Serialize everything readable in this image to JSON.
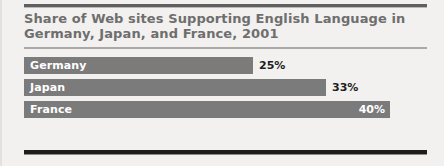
{
  "chart_data": {
    "type": "bar",
    "orientation": "horizontal",
    "title": "Share of Web sites Supporting English Language in\nGermany, Japan, and France, 2001",
    "xlabel": "",
    "ylabel": "",
    "categories": [
      "Germany",
      "Japan",
      "France"
    ],
    "values": [
      25,
      33,
      40
    ],
    "value_labels": [
      "25%",
      "33%",
      "40%"
    ],
    "xlim": [
      0,
      44
    ],
    "grid": false,
    "legend": null,
    "bar_color": "#7b7b7b",
    "title_color": "#6e6e6e",
    "label_color": "#ffffff",
    "value_color_outside": "#1d1d1d",
    "value_color_inside": "#ffffff",
    "background_color": "#f2f1ef",
    "bars": [
      {
        "category": "Germany",
        "value": 25,
        "value_label": "25%",
        "label_position": "inside",
        "value_position": "outside"
      },
      {
        "category": "Japan",
        "value": 33,
        "value_label": "33%",
        "label_position": "inside",
        "value_position": "outside"
      },
      {
        "category": "France",
        "value": 40,
        "value_label": "40%",
        "label_position": "inside",
        "value_position": "inside"
      }
    ]
  }
}
